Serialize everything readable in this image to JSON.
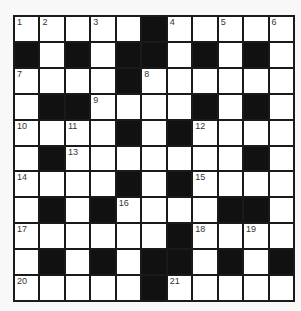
{
  "puzzle": {
    "type": "crossword",
    "rows": 11,
    "cols": 11,
    "colors": {
      "block": "#111111",
      "cell": "#ffffff",
      "grid_line": "#1a1a1a",
      "number": "#333333",
      "background": "#f8f8f8"
    },
    "grid": [
      [
        "1",
        "2",
        "",
        "3",
        "",
        "#",
        "4",
        "",
        "5",
        "",
        "6"
      ],
      [
        "#",
        "",
        "#",
        "",
        "#",
        "#",
        "",
        "#",
        "",
        "#",
        ""
      ],
      [
        "7",
        "",
        "",
        "",
        "#",
        "8",
        "",
        "",
        "",
        "",
        ""
      ],
      [
        "",
        "#",
        "#",
        "9",
        "",
        "",
        "",
        "#",
        "",
        "#",
        ""
      ],
      [
        "10",
        "",
        "11",
        "",
        "#",
        "",
        "#",
        "12",
        "",
        "",
        ""
      ],
      [
        "",
        "#",
        "13",
        "",
        "",
        "",
        "",
        "",
        "",
        "#",
        ""
      ],
      [
        "14",
        "",
        "",
        "",
        "#",
        "",
        "#",
        "15",
        "",
        "",
        ""
      ],
      [
        "",
        "#",
        "",
        "#",
        "16",
        "",
        "",
        "",
        "#",
        "#",
        ""
      ],
      [
        "17",
        "",
        "",
        "",
        "",
        "",
        "#",
        "18",
        "",
        "19",
        ""
      ],
      [
        "",
        "#",
        "",
        "#",
        "",
        "#",
        "#",
        "",
        "#",
        "",
        "#"
      ],
      [
        "20",
        "",
        "",
        "",
        "",
        "#",
        "21",
        "",
        "",
        "",
        ""
      ]
    ],
    "clue_numbers": [
      "1",
      "2",
      "3",
      "4",
      "5",
      "6",
      "7",
      "8",
      "9",
      "10",
      "11",
      "12",
      "13",
      "14",
      "15",
      "16",
      "17",
      "18",
      "19",
      "20",
      "21"
    ]
  }
}
